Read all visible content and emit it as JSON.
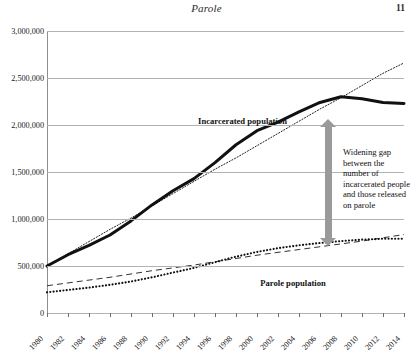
{
  "page": {
    "running_head": "Parole",
    "folio": "11"
  },
  "annotations": {
    "incarcerated_label": "Incarcerated population",
    "parole_label": "Parole population",
    "gap_note": "Widening gap between the number of incarcerated people and those released on parole",
    "gap_arrow_icon": "double-headed-vertical-arrow",
    "arrow_color": "#9a9a9a"
  },
  "chart_data": {
    "type": "line",
    "title": "",
    "xlabel": "",
    "ylabel": "",
    "xlim": [
      1980,
      2014
    ],
    "ylim": [
      0,
      3000000
    ],
    "grid": true,
    "legend": "none (inline labels)",
    "ytick_labels": [
      "0",
      "500,000",
      "1,000,000",
      "1,500,000",
      "2,000,000",
      "2,500,000",
      "3,000,000"
    ],
    "ytick_values": [
      0,
      500000,
      1000000,
      1500000,
      2000000,
      2500000,
      3000000
    ],
    "xtick_labels": [
      "1980",
      "1982",
      "1984",
      "1986",
      "1988",
      "1990",
      "1992",
      "1994",
      "1996",
      "1998",
      "2000",
      "2002",
      "2004",
      "2006",
      "2008",
      "2010",
      "2012",
      "2014"
    ],
    "xtick_values": [
      1980,
      1982,
      1984,
      1986,
      1988,
      1990,
      1992,
      1994,
      1996,
      1998,
      2000,
      2002,
      2004,
      2006,
      2008,
      2010,
      2012,
      2014
    ],
    "x": [
      1980,
      1982,
      1984,
      1986,
      1988,
      1990,
      1992,
      1994,
      1996,
      1998,
      2000,
      2002,
      2004,
      2006,
      2008,
      2010,
      2012,
      2014
    ],
    "series": [
      {
        "name": "Incarcerated population",
        "style": "solid-thick",
        "color": "#111111",
        "values": [
          500000,
          620000,
          720000,
          830000,
          980000,
          1150000,
          1300000,
          1430000,
          1600000,
          1790000,
          1940000,
          2030000,
          2140000,
          2240000,
          2300000,
          2280000,
          2240000,
          2230000
        ]
      },
      {
        "name": "Incarcerated trend",
        "style": "dotted-fine",
        "color": "#222222",
        "values": [
          500000,
          630000,
          760000,
          890000,
          1010000,
          1140000,
          1270000,
          1400000,
          1530000,
          1650000,
          1780000,
          1910000,
          2040000,
          2170000,
          2290000,
          2420000,
          2550000,
          2660000
        ]
      },
      {
        "name": "Parole trend",
        "style": "dashed",
        "color": "#333333",
        "values": [
          290000,
          320000,
          350000,
          380000,
          415000,
          450000,
          480000,
          510000,
          545000,
          580000,
          615000,
          645000,
          675000,
          705000,
          735000,
          765000,
          800000,
          835000
        ]
      },
      {
        "name": "Parole population",
        "style": "dotted-bold",
        "color": "#111111",
        "values": [
          220000,
          245000,
          270000,
          300000,
          335000,
          380000,
          430000,
          480000,
          540000,
          600000,
          650000,
          690000,
          720000,
          745000,
          765000,
          780000,
          790000,
          790000
        ]
      }
    ]
  }
}
